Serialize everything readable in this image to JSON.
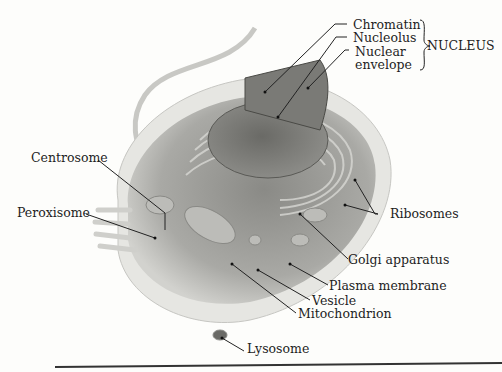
{
  "diagram": {
    "group_label": "NUCLEUS",
    "labels": {
      "chromatin": "Chromatin",
      "nucleolus": "Nucleolus",
      "nuclear_envelope_1": "Nuclear",
      "nuclear_envelope_2": "envelope",
      "centrosome": "Centrosome",
      "peroxisome": "Peroxisome",
      "ribosomes": "Ribosomes",
      "golgi": "Golgi apparatus",
      "plasma_membrane": "Plasma membrane",
      "vesicle": "Vesicle",
      "mitochondrion": "Mitochondrion",
      "lysosome": "Lysosome"
    }
  }
}
